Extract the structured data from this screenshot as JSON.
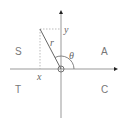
{
  "diagram": {
    "type": "CAST quadrant diagram",
    "quadrants": {
      "top_left": "S",
      "top_right": "A",
      "bottom_left": "T",
      "bottom_right": "C"
    },
    "labels": {
      "x": "x",
      "y": "y",
      "r": "r",
      "theta": "θ"
    },
    "colors": {
      "axis": "#999999",
      "text": "#777777",
      "arrow": "#222222"
    }
  }
}
